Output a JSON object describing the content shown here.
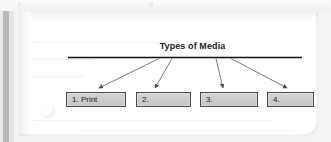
{
  "document": {
    "type": "scanned-worksheet",
    "page_background": "#ffffff",
    "scanner_background": "#f4f4f4"
  },
  "header_ghost": {
    "left_fragment": "1.",
    "center_fragment": "g",
    "right_fragment": "."
  },
  "diagram": {
    "title": "Types of Media",
    "line_color": "#000000",
    "arrow_color": "#555555",
    "box_fill": "#cccccc",
    "box_border": "#4a4a4a",
    "boxes": [
      {
        "id": "box-1",
        "label": "1. Print"
      },
      {
        "id": "box-2",
        "label": "2."
      },
      {
        "id": "box-3",
        "label": "3."
      },
      {
        "id": "box-4",
        "label": "4."
      }
    ]
  }
}
